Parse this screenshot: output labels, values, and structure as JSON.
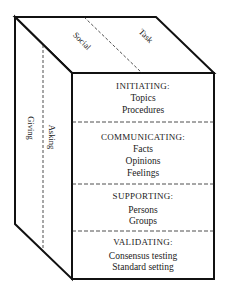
{
  "diagram": {
    "type": "3d-box",
    "colors": {
      "line": "#111111",
      "text": "#1a1a1a",
      "background": "#ffffff"
    },
    "top_face": {
      "labels": [
        "Social",
        "Task"
      ]
    },
    "side_face": {
      "labels": [
        "Giving",
        "Asking"
      ]
    },
    "front_face": {
      "sections": [
        {
          "heading": "INITIATING:",
          "items": [
            "Topics",
            "Procedures"
          ]
        },
        {
          "heading": "COMMUNICATING:",
          "items": [
            "Facts",
            "Opinions",
            "Feelings"
          ]
        },
        {
          "heading": "SUPPORTING:",
          "items": [
            "Persons",
            "Groups"
          ]
        },
        {
          "heading": "VALIDATING:",
          "items": [
            "Consensus testing",
            "Standard setting"
          ]
        }
      ]
    }
  }
}
